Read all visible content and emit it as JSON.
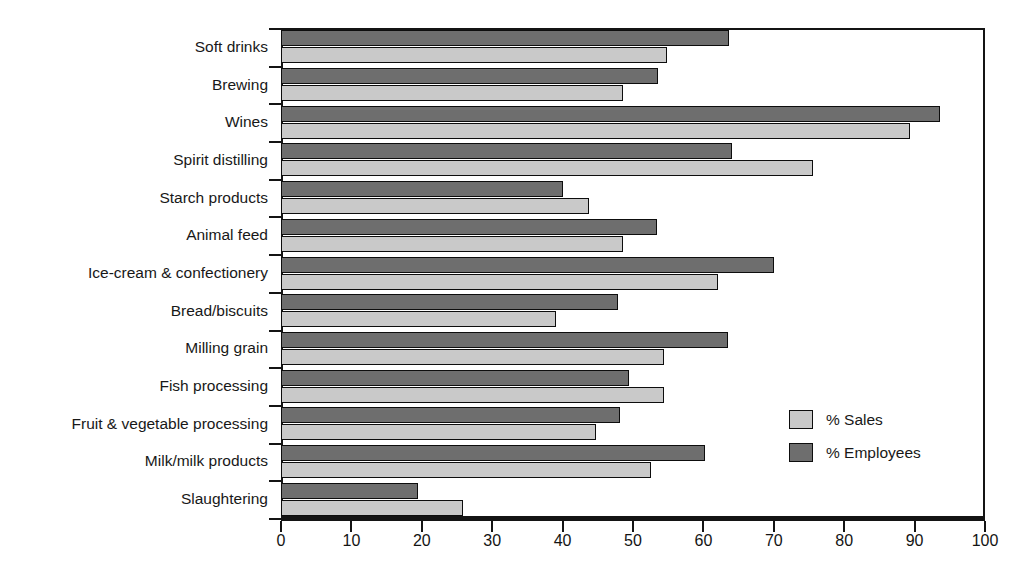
{
  "chart_data": {
    "type": "bar",
    "orientation": "horizontal",
    "title": "",
    "subtitle": "",
    "xlabel": "",
    "ylabel": "",
    "xlim": [
      0,
      100
    ],
    "xticks": [
      0,
      10,
      20,
      30,
      40,
      50,
      60,
      70,
      80,
      90,
      100
    ],
    "xtick_labels": [
      "0",
      "10",
      "20",
      "30",
      "40",
      "50",
      "60",
      "70",
      "80",
      "90",
      "100"
    ],
    "grid": false,
    "legend_position": "inside-right",
    "categories": [
      "Soft drinks",
      "Brewing",
      "Wines",
      "Spirit distilling",
      "Starch products",
      "Animal feed",
      "Ice-cream & confectionery",
      "Bread/biscuits",
      "Milling grain",
      "Fish processing",
      "Fruit & vegetable processing",
      "Milk/milk products",
      "Slaughtering"
    ],
    "series": [
      {
        "name": "% Employees",
        "color": "#6e6e6e",
        "values": [
          63.6,
          53.5,
          93.6,
          64.1,
          40.1,
          53.4,
          70.0,
          47.8,
          63.5,
          49.5,
          48.2,
          60.2,
          19.5
        ]
      },
      {
        "name": "% Sales",
        "color": "#c9c9c9",
        "values": [
          54.8,
          48.6,
          89.4,
          75.5,
          43.8,
          48.6,
          62.1,
          39.1,
          54.4,
          54.4,
          44.8,
          52.6,
          25.8
        ]
      }
    ]
  },
  "legend": {
    "items": [
      {
        "label": "% Sales",
        "key": "sales"
      },
      {
        "label": "% Employees",
        "key": "employees"
      }
    ]
  },
  "colors": {
    "employees": "#6e6e6e",
    "sales": "#c9c9c9",
    "axis": "#141414",
    "background": "#ffffff"
  }
}
